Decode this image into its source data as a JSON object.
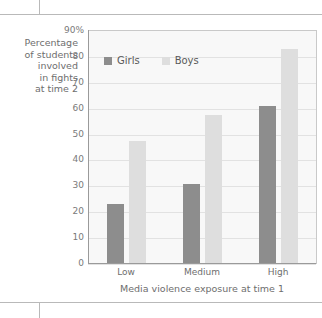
{
  "chart_data": {
    "type": "bar",
    "title": "",
    "categories": [
      "Low",
      "Medium",
      "High"
    ],
    "series": [
      {
        "name": "Girls",
        "values": [
          23,
          31,
          61
        ],
        "color": "#8d8d8d"
      },
      {
        "name": "Boys",
        "values": [
          47.5,
          57.5,
          83
        ],
        "color": "#dedede"
      }
    ],
    "xlabel": "Media violence exposure at time 1",
    "ylabel": "Percentage of students involved in fights at time 2",
    "ylim": [
      0,
      90
    ],
    "ytick_values": [
      0,
      10,
      20,
      30,
      40,
      50,
      60,
      70,
      80,
      90
    ],
    "ytick_labels": [
      "0",
      "10",
      "20",
      "30",
      "40",
      "50",
      "60",
      "70",
      "80",
      "90%"
    ],
    "grid": true,
    "legend_position": "upper-left-inside"
  },
  "y_axis_caption_lines": [
    "Percentage",
    "of students",
    "involved",
    "in fights",
    "at time 2"
  ],
  "legend": {
    "items": [
      {
        "label": "Girls",
        "color": "#8d8d8d"
      },
      {
        "label": "Boys",
        "color": "#dedede"
      }
    ]
  },
  "x_axis": {
    "title": "Media violence exposure at time 1",
    "ticks": [
      "Low",
      "Medium",
      "High"
    ]
  },
  "colors": {
    "girls": "#8d8d8d",
    "boys": "#dedede",
    "plot_background": "#f8f8f8",
    "gridline": "#e2e2e2",
    "axis": "#9a9a9a",
    "text": "#6e6e6e",
    "rule": "#b9b9b9"
  }
}
